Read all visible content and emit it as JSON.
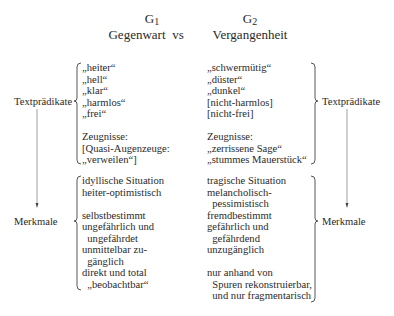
{
  "header": {
    "left": {
      "symbol": "G",
      "sub": "1",
      "label": "Gegenwart"
    },
    "vs": "vs",
    "right": {
      "symbol": "G",
      "sub": "2",
      "label": "Vergangenheit"
    }
  },
  "row_labels": {
    "top_left": "Textprädikate",
    "top_right": "Textprädikate",
    "bottom_left": "Merkmale",
    "bottom_right": "Merkmale"
  },
  "textpraedikate": {
    "left": [
      "„heiter“",
      "„hell“",
      "„klar“",
      "„harmlos“",
      "„frei“",
      "",
      "Zeugnisse:",
      "[Quasi-Augenzeuge:",
      "„verweilen“]"
    ],
    "right": [
      "„schwermütig“",
      "„düster“",
      "„dunkel“",
      "[nicht-harmlos]",
      "[nicht-frei]",
      "",
      "Zeugnisse:",
      "„zerrissene Sage“",
      "„stummes Mauerstück“"
    ]
  },
  "merkmale": {
    "left": [
      "idyllische Situation",
      "heiter-optimistisch",
      "",
      "selbstbestimmt",
      "ungefährlich und",
      "  ungefährdet",
      "unmittelbar zu-",
      "  gänglich",
      "direkt und total",
      "  „beobachtbar“"
    ],
    "right": [
      "tragische Situation",
      "melancholisch-",
      "  pessimistisch",
      "fremdbestimmt",
      "gefährlich und",
      "  gefährdend",
      "unzugänglich",
      "",
      "nur anhand von",
      "  Spuren rekonstruierbar,",
      "  und nur fragmentarisch"
    ]
  }
}
